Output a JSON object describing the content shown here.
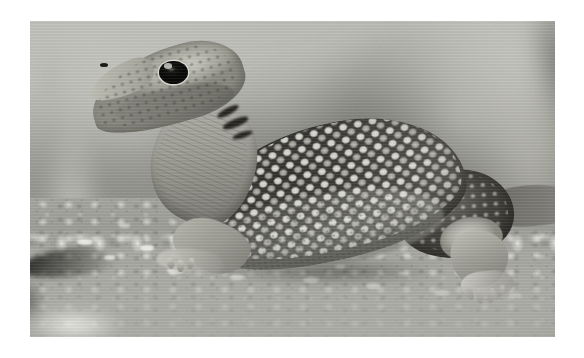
{
  "image": {
    "domain": "Natural-Image",
    "subject": "spotted lizard",
    "subject_description": "A spotted lizard standing on sandy, pebbly ground, photographed in profile facing left",
    "alt_text": "Close-up photograph of a light grey spotted lizard with a long pointed snout, large dark eye and rows of pale ocellated spots along its dark back, standing on sandy gravel with a blurred background",
    "rendering": "desaturated / near-monochrome photograph",
    "orientation": "landscape",
    "border": {
      "style": "white margin",
      "color": "#ffffff"
    },
    "canvas": {
      "width": 584,
      "height": 358
    },
    "photo_area": {
      "left": 30,
      "top": 21,
      "width": 525,
      "height": 316
    }
  },
  "palette": {
    "border_white": "#ffffff",
    "sky_light_grey": "#c3c3bd",
    "background_mid_grey": "#a8a8a2",
    "background_dark_grey": "#6e6e68",
    "ground_sand": "#a7a7a1",
    "pebble_highlight": "#eeeee8",
    "body_dark": "#343330",
    "body_shadow": "#26251f",
    "spot_pale": "#e8e8e2",
    "head_light": "#c4c4bb",
    "eye_black": "#0d0d0b",
    "eye_ring": "#e2e2db"
  },
  "subject_parts": [
    {
      "name": "head",
      "label": "Head with pointed snout"
    },
    {
      "name": "eye",
      "label": "Large dark eye with pale ring"
    },
    {
      "name": "nostril",
      "label": "Nostril"
    },
    {
      "name": "neck",
      "label": "Ridged neck and throat"
    },
    {
      "name": "torso",
      "label": "Dark torso with pale ocellated spots"
    },
    {
      "name": "rump",
      "label": "Hindquarters"
    },
    {
      "name": "thigh",
      "label": "Pale hind thigh"
    },
    {
      "name": "tail",
      "label": "Tail extending off the right edge"
    },
    {
      "name": "foreleg",
      "label": "Front leg and clawed foot"
    },
    {
      "name": "hindleg",
      "label": "Hind leg and clawed foot"
    }
  ],
  "scene_elements": [
    {
      "name": "ground",
      "label": "Sandy gravel ground"
    },
    {
      "name": "pebbles",
      "label": "Small pale pebbles and grit"
    },
    {
      "name": "dark-stone",
      "label": "Dark flat stone at lower left"
    },
    {
      "name": "background-blur",
      "label": "Out-of-focus grey background"
    },
    {
      "name": "foreground-blur",
      "label": "Out-of-focus foreground band"
    },
    {
      "name": "body-shadow",
      "label": "Shadow beneath the lizard"
    }
  ],
  "pebble_highlights": [
    {
      "x": 9,
      "y": 69,
      "w": 3.0,
      "h": 2.0,
      "color": "rgba(246,246,240,.9)"
    },
    {
      "x": 14,
      "y": 74,
      "w": 2.2,
      "h": 1.6,
      "color": "rgba(240,240,234,.8)"
    },
    {
      "x": 21,
      "y": 71,
      "w": 2.6,
      "h": 1.8,
      "color": "rgba(250,250,244,.85)"
    },
    {
      "x": 26,
      "y": 78,
      "w": 3.4,
      "h": 2.2,
      "color": "rgba(244,244,238,.75)"
    },
    {
      "x": 33,
      "y": 73,
      "w": 2.0,
      "h": 1.5,
      "color": "rgba(236,236,230,.8)"
    },
    {
      "x": 38,
      "y": 80,
      "w": 2.8,
      "h": 1.9,
      "color": "rgba(250,250,245,.7)"
    },
    {
      "x": 45,
      "y": 76,
      "w": 2.2,
      "h": 1.6,
      "color": "rgba(238,238,232,.75)"
    },
    {
      "x": 52,
      "y": 81,
      "w": 3.0,
      "h": 2.0,
      "color": "rgba(248,248,242,.7)"
    },
    {
      "x": 58,
      "y": 77,
      "w": 2.0,
      "h": 1.4,
      "color": "rgba(234,234,228,.7)"
    },
    {
      "x": 64,
      "y": 83,
      "w": 2.6,
      "h": 1.8,
      "color": "rgba(246,246,240,.65)"
    },
    {
      "x": 70,
      "y": 79,
      "w": 2.2,
      "h": 1.5,
      "color": "rgba(238,238,232,.6)"
    },
    {
      "x": 77,
      "y": 85,
      "w": 3.0,
      "h": 2.0,
      "color": "rgba(248,248,243,.6)"
    },
    {
      "x": 85,
      "y": 80,
      "w": 2.4,
      "h": 1.7,
      "color": "rgba(240,240,234,.6)"
    },
    {
      "x": 91,
      "y": 86,
      "w": 2.8,
      "h": 1.9,
      "color": "rgba(246,246,240,.55)"
    },
    {
      "x": 17,
      "y": 64,
      "w": 2.0,
      "h": 1.4,
      "color": "rgba(230,230,224,.6)"
    },
    {
      "x": 41,
      "y": 67,
      "w": 1.8,
      "h": 1.3,
      "color": "rgba(232,232,226,.55)"
    },
    {
      "x": 63,
      "y": 70,
      "w": 2.0,
      "h": 1.4,
      "color": "rgba(236,236,230,.5)"
    },
    {
      "x": 88,
      "y": 72,
      "w": 2.2,
      "h": 1.5,
      "color": "rgba(238,238,232,.5)"
    }
  ],
  "dark_streaks": [
    {
      "x": 35.5,
      "y": 27.5,
      "w": 4.5,
      "h": 2.2,
      "rot": -28
    },
    {
      "x": 36.5,
      "y": 31.0,
      "w": 5.2,
      "h": 2.4,
      "rot": -22
    },
    {
      "x": 38.5,
      "y": 35.0,
      "w": 4.0,
      "h": 2.0,
      "rot": -18
    }
  ],
  "toes": [
    {
      "x": 83.0,
      "y": 84.0,
      "w": 1.4,
      "h": 4.5,
      "rot": -24
    },
    {
      "x": 85.0,
      "y": 84.5,
      "w": 1.4,
      "h": 5.0,
      "rot": -8
    },
    {
      "x": 87.2,
      "y": 84.5,
      "w": 1.3,
      "h": 4.6,
      "rot": 8
    },
    {
      "x": 89.2,
      "y": 83.5,
      "w": 1.2,
      "h": 3.8,
      "rot": 22
    },
    {
      "x": 26.0,
      "y": 75.0,
      "w": 1.3,
      "h": 3.6,
      "rot": -16
    },
    {
      "x": 28.0,
      "y": 75.5,
      "w": 1.3,
      "h": 3.9,
      "rot": -2
    },
    {
      "x": 30.0,
      "y": 75.0,
      "w": 1.2,
      "h": 3.4,
      "rot": 12
    }
  ]
}
